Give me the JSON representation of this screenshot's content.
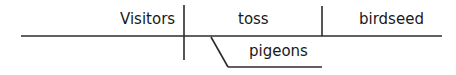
{
  "diagram": {
    "type": "sentence-diagram",
    "style": "Reed-Kellogg",
    "line_color": "#2b2b2b",
    "text_color": "#1a1a1a",
    "words": {
      "subject": "Visitors",
      "verb": "toss",
      "direct_object": "birdseed",
      "indirect_object": "pigeons"
    },
    "lines": {
      "baseline": {
        "x1": 21,
        "y1": 36,
        "x2": 442,
        "y2": 36
      },
      "subject_verb_divider": {
        "x1": 184,
        "y1": 5,
        "x2": 184,
        "y2": 60
      },
      "verb_object_divider": {
        "x1": 322,
        "y1": 6,
        "x2": 322,
        "y2": 36
      },
      "indirect_object_slant": {
        "x1": 211,
        "y1": 37,
        "x2": 228,
        "y2": 67
      },
      "indirect_object_base": {
        "x1": 228,
        "y1": 67,
        "x2": 322,
        "y2": 67
      }
    }
  }
}
